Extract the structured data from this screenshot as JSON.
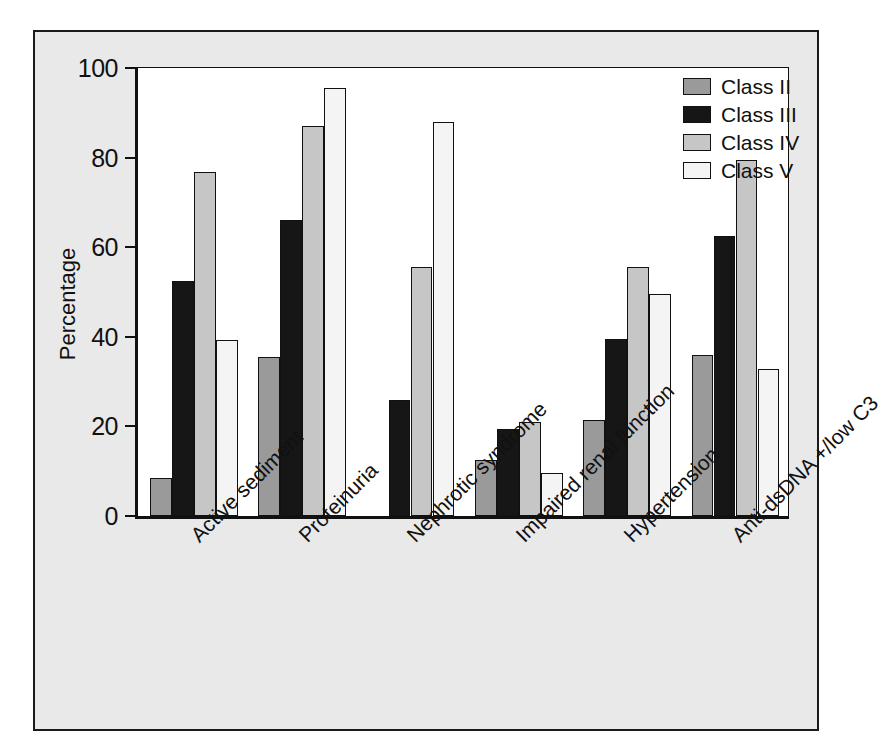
{
  "chart_data": {
    "type": "bar",
    "title": "",
    "xlabel": "",
    "ylabel": "Percentage",
    "ylim": [
      0,
      100
    ],
    "yticks": [
      0,
      20,
      40,
      60,
      80,
      100
    ],
    "grid": false,
    "legend_position": "top-right",
    "categories": [
      "Active sediment",
      "Proteinuria",
      "Nephrotic syndrome",
      "Impaired renal function",
      "Hypertension",
      "Anti-dsDNA +/low C3"
    ],
    "series": [
      {
        "name": "Class II",
        "color": "#9a9a9a",
        "values": [
          8.5,
          35.5,
          null,
          12.5,
          21.5,
          36.0
        ]
      },
      {
        "name": "Class III",
        "color": "#161616",
        "values": [
          52.5,
          66.0,
          26.0,
          19.5,
          39.5,
          62.5
        ]
      },
      {
        "name": "Class IV",
        "color": "#c6c6c6",
        "values": [
          76.8,
          87.0,
          55.5,
          21.0,
          55.5,
          79.5
        ]
      },
      {
        "name": "Class V",
        "color": "#f4f4f4",
        "values": [
          39.2,
          95.5,
          88.0,
          9.5,
          49.5,
          32.8
        ]
      }
    ]
  },
  "colors": {
    "figure_background": "#e9e9e9",
    "plot_background": "#ffffff",
    "frame": "#1a1a1a",
    "axis": "#111111",
    "text": "#111111"
  }
}
